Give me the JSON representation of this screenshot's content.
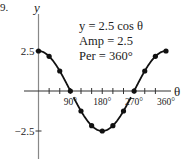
{
  "figure_label": "9.",
  "chart_data": {
    "type": "line",
    "function": "y = 2.5 cos θ",
    "annotation_lines": [
      "y = 2.5 cos θ",
      "Amp = 2.5",
      "Per = 360°"
    ],
    "xlabel": "θ",
    "ylabel": "y",
    "xlim": [
      0,
      360
    ],
    "ylim": [
      -2.5,
      2.5
    ],
    "x_tick_step": 30,
    "x_tick_labels": [
      {
        "value": 90,
        "label": "90°"
      },
      {
        "value": 180,
        "label": "180°"
      },
      {
        "value": 270,
        "label": "270°"
      },
      {
        "value": 360,
        "label": "360°"
      }
    ],
    "y_tick_labels": [
      {
        "value": 2.5,
        "label": "2.5"
      },
      {
        "value": -2.5,
        "label": "−2.5"
      }
    ],
    "series": [
      {
        "name": "y = 2.5 cos θ",
        "x": [
          0,
          30,
          60,
          90,
          120,
          150,
          180,
          210,
          240,
          270,
          300,
          330,
          360
        ],
        "y": [
          2.5,
          2.165,
          1.25,
          0,
          -1.25,
          -2.165,
          -2.5,
          -2.165,
          -1.25,
          0,
          1.25,
          2.165,
          2.5
        ]
      }
    ],
    "grid": false,
    "legend": "none",
    "colors": {
      "line": "#111111",
      "axis": "#888888",
      "text": "#222222"
    }
  }
}
